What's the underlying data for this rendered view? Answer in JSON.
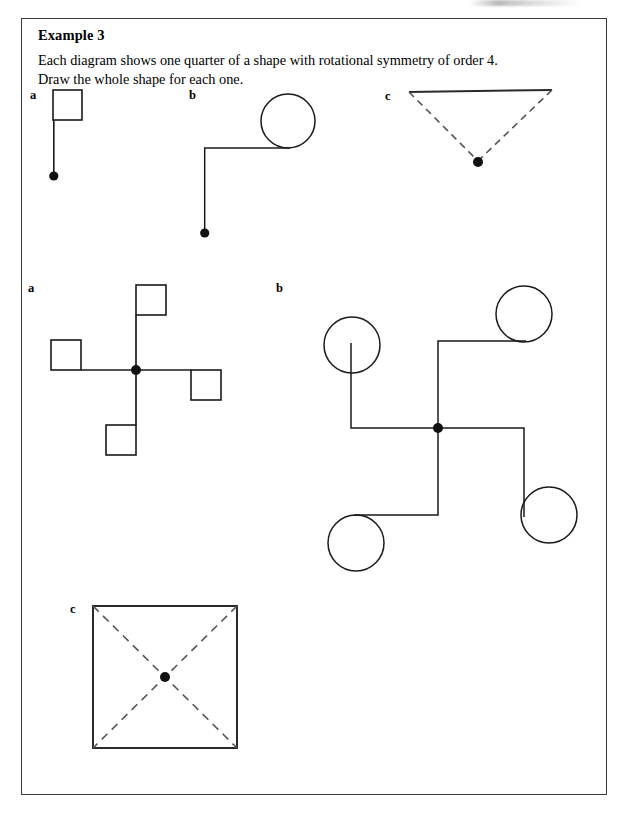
{
  "page": {
    "background_color": "#ffffff",
    "ink_color": "#1a1a1a",
    "border_color": "#3a3a3a"
  },
  "example_box": {
    "title": "Example 3",
    "instruction_line_1": "Each diagram shows one quarter of a shape with rotational symmetry of order 4.",
    "instruction_line_2": "Draw the whole shape for each one."
  },
  "question_row": {
    "labels": {
      "a": "a",
      "b": "b",
      "c": "c"
    }
  },
  "answer_rows": {
    "labels": {
      "a": "a",
      "b": "b",
      "c": "c"
    }
  },
  "figures": {
    "q_a": {
      "name": "quarter-square-on-stalk",
      "description": "A small square sitting on top of a vertical line segment that ends at a filled centre dot.",
      "square": {
        "x": 53,
        "y": 90,
        "width": 29,
        "height": 30
      },
      "stalk": {
        "x1": 53,
        "y1": 120,
        "x2": 53,
        "y2": 174
      },
      "centre_dot": {
        "cx": 53,
        "cy": 176,
        "r": 4.5
      }
    },
    "q_b": {
      "name": "quarter-circle-on-elbow",
      "description": "A circle attached to a horizontal arm that turns down a vertical arm ending at a filled centre dot.",
      "circle": {
        "cx": 288,
        "cy": 121,
        "r": 27
      },
      "arm_horizontal": {
        "x1": 204,
        "y1": 148,
        "x2": 288,
        "y2": 148
      },
      "arm_vertical": {
        "x1": 204,
        "y1": 148,
        "x2": 204,
        "y2": 231
      },
      "centre_dot": {
        "cx": 204,
        "cy": 233,
        "r": 4.5
      }
    },
    "q_c": {
      "name": "quarter-triangle-dashed",
      "description": "A triangle with a solid top edge and two dashed sides meeting at a filled centre dot below.",
      "top_edge": {
        "x1": 409,
        "y1": 92,
        "x2": 552,
        "y2": 90
      },
      "dashed_left": {
        "x1": 409,
        "y1": 92,
        "x2": 478,
        "y2": 161
      },
      "dashed_right": {
        "x1": 552,
        "y1": 90,
        "x2": 478,
        "y2": 161
      },
      "centre_dot": {
        "cx": 478,
        "cy": 162,
        "r": 5
      }
    },
    "a_a": {
      "name": "pinwheel-of-four-squares",
      "description": "Four arms radiating from a centre dot, each ending in a square, forming rotational symmetry of order 4.",
      "centre_dot": {
        "cx": 136,
        "cy": 370,
        "r": 5
      },
      "arms": [
        {
          "direction": "up",
          "x1": 136,
          "y1": 370,
          "x2": 136,
          "y2": 315
        },
        {
          "direction": "left",
          "x1": 136,
          "y1": 370,
          "x2": 81,
          "y2": 370
        },
        {
          "direction": "down",
          "x1": 136,
          "y1": 370,
          "x2": 136,
          "y2": 425
        },
        {
          "direction": "right",
          "x1": 136,
          "y1": 370,
          "x2": 191,
          "y2": 370
        }
      ],
      "squares": [
        {
          "position": "top",
          "x": 136,
          "y": 285,
          "width": 30,
          "height": 30
        },
        {
          "position": "left",
          "x": 51,
          "y": 340,
          "width": 30,
          "height": 30
        },
        {
          "position": "bottom",
          "x": 106,
          "y": 425,
          "width": 30,
          "height": 30
        },
        {
          "position": "right",
          "x": 191,
          "y": 370,
          "width": 30,
          "height": 30
        }
      ]
    },
    "a_b": {
      "name": "pinwheel-of-four-circles",
      "description": "Four elbowed arms radiating from a centre dot, each ending in a circle, rotational symmetry of order 4.",
      "centre_dot": {
        "cx": 438,
        "cy": 428,
        "r": 5
      },
      "arms": [
        {
          "direction": "up-right",
          "points": "438,428 438,341 524,341"
        },
        {
          "direction": "up-left",
          "points": "438,428 352,428 352,341"
        },
        {
          "direction": "down-left",
          "points": "438,428 438,515 352,515"
        },
        {
          "direction": "down-right",
          "points": "438,428 524,428 524,515"
        }
      ],
      "circles": [
        {
          "position": "top-right",
          "cx": 524,
          "cy": 314,
          "r": 28
        },
        {
          "position": "top-left",
          "cx": 352,
          "cy": 345,
          "r": 28
        },
        {
          "position": "bottom-left",
          "cx": 356,
          "cy": 543,
          "r": 28
        },
        {
          "position": "bottom-right",
          "cx": 549,
          "cy": 515,
          "r": 28
        }
      ]
    },
    "a_c": {
      "name": "square-with-dashed-diagonals",
      "description": "A solid square with two dashed diagonals crossing at a filled centre dot.",
      "square": {
        "x": 93,
        "y": 606,
        "width": 144,
        "height": 142
      },
      "diagonal_1": {
        "x1": 93,
        "y1": 606,
        "x2": 237,
        "y2": 748
      },
      "diagonal_2": {
        "x1": 237,
        "y1": 606,
        "x2": 93,
        "y2": 748
      },
      "centre_dot": {
        "cx": 165,
        "cy": 677,
        "r": 5
      }
    }
  },
  "figure_label_positions": {
    "q_a": {
      "x": 30,
      "y": 90
    },
    "q_b": {
      "x": 189,
      "y": 90
    },
    "q_c": {
      "x": 385,
      "y": 91
    },
    "a_a": {
      "x": 28,
      "y": 283
    },
    "a_b": {
      "x": 276,
      "y": 283
    },
    "a_c": {
      "x": 70,
      "y": 604
    }
  }
}
